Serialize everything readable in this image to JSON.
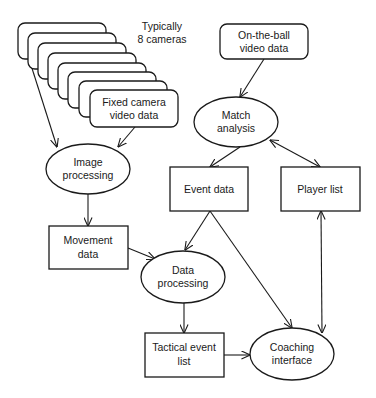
{
  "diagram": {
    "camera_stack": {
      "count_label_line1": "Typically",
      "count_label_line2": "8 cameras",
      "count": 8
    },
    "nodes": {
      "fixed_camera": {
        "line1": "Fixed camera",
        "line2": "video data",
        "shape": "rounded-rect"
      },
      "on_the_ball": {
        "line1": "On-the-ball",
        "line2": "video data",
        "shape": "rounded-rect"
      },
      "match_analysis": {
        "line1": "Match",
        "line2": "analysis",
        "shape": "ellipse"
      },
      "image_processing": {
        "line1": "Image",
        "line2": "processing",
        "shape": "ellipse"
      },
      "event_data": {
        "line1": "Event data",
        "shape": "rect"
      },
      "player_list": {
        "line1": "Player list",
        "shape": "rect"
      },
      "movement_data": {
        "line1": "Movement",
        "line2": "data",
        "shape": "rect"
      },
      "data_processing": {
        "line1": "Data",
        "line2": "processing",
        "shape": "ellipse"
      },
      "tactical_event_list": {
        "line1": "Tactical event",
        "line2": "list",
        "shape": "rect"
      },
      "coaching_interface": {
        "line1": "Coaching",
        "line2": "interface",
        "shape": "ellipse"
      }
    },
    "edges": [
      {
        "from": "camera_stack",
        "to": "image_processing",
        "type": "arrow"
      },
      {
        "from": "fixed_camera",
        "to": "image_processing",
        "type": "arrow"
      },
      {
        "from": "on_the_ball",
        "to": "match_analysis",
        "type": "arrow"
      },
      {
        "from": "match_analysis",
        "to": "event_data",
        "type": "arrow"
      },
      {
        "from": "match_analysis",
        "to": "player_list",
        "type": "bidirectional"
      },
      {
        "from": "image_processing",
        "to": "movement_data",
        "type": "arrow"
      },
      {
        "from": "movement_data",
        "to": "data_processing",
        "type": "arrow"
      },
      {
        "from": "event_data",
        "to": "data_processing",
        "type": "arrow"
      },
      {
        "from": "event_data",
        "to": "coaching_interface",
        "type": "arrow"
      },
      {
        "from": "player_list",
        "to": "coaching_interface",
        "type": "bidirectional"
      },
      {
        "from": "data_processing",
        "to": "tactical_event_list",
        "type": "arrow"
      },
      {
        "from": "tactical_event_list",
        "to": "coaching_interface",
        "type": "arrow"
      }
    ]
  }
}
